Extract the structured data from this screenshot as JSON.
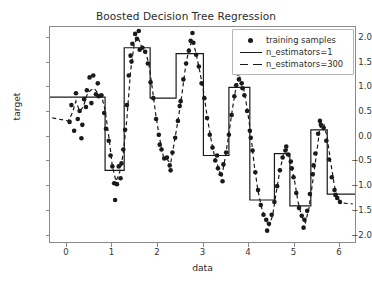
{
  "figure": {
    "width": 372,
    "height": 291,
    "background": "#ffffff"
  },
  "chart_data": {
    "type": "scatter",
    "title": "Boosted Decision Tree Regression",
    "xlabel": "data",
    "ylabel": "target",
    "xlim": [
      -0.35,
      6.35
    ],
    "ylim": [
      -2.15,
      2.2
    ],
    "xticks": [
      0,
      1,
      2,
      3,
      4,
      5,
      6
    ],
    "xtick_labels": [
      "0",
      "1",
      "2",
      "3",
      "4",
      "5",
      "6"
    ],
    "yticks": [
      -2.0,
      -1.5,
      -1.0,
      -0.5,
      0.0,
      0.5,
      1.0,
      1.5,
      2.0
    ],
    "ytick_labels": [
      "−2.0",
      "−1.5",
      "−1.0",
      "−0.5",
      "0.0",
      "0.5",
      "1.0",
      "1.5",
      "2.0"
    ],
    "grid": false,
    "legend_position": "upper right",
    "legend": [
      {
        "label": "training samples",
        "style": "marker",
        "marker": "o",
        "color": "#1a1a1a"
      },
      {
        "label": "n_estimators=1",
        "style": "solid",
        "color": "#1a1a1a"
      },
      {
        "label": "n_estimators=300",
        "style": "dashed",
        "color": "#1a1a1a"
      }
    ],
    "series": [
      {
        "name": "training samples",
        "style": "scatter",
        "color": "#1a1a1a",
        "marker_size": 4.6,
        "points": [
          [
            0.08,
            0.28
          ],
          [
            0.12,
            0.62
          ],
          [
            0.18,
            0.1
          ],
          [
            0.22,
            0.86
          ],
          [
            0.3,
            0.5
          ],
          [
            0.34,
            -0.05
          ],
          [
            0.4,
            0.74
          ],
          [
            0.46,
            0.92
          ],
          [
            0.52,
            1.18
          ],
          [
            0.56,
            0.66
          ],
          [
            0.6,
            1.22
          ],
          [
            0.66,
            0.84
          ],
          [
            0.72,
            0.8
          ],
          [
            0.78,
            0.82
          ],
          [
            0.84,
            0.46
          ],
          [
            0.88,
            0.14
          ],
          [
            0.94,
            -0.1
          ],
          [
            0.98,
            -0.4
          ],
          [
            1.02,
            -0.62
          ],
          [
            1.06,
            -0.96
          ],
          [
            1.12,
            -0.98
          ],
          [
            1.16,
            -0.62
          ],
          [
            1.22,
            -0.56
          ],
          [
            1.26,
            -0.28
          ],
          [
            1.3,
            0.12
          ],
          [
            1.34,
            0.62
          ],
          [
            1.38,
            1.22
          ],
          [
            1.42,
            1.62
          ],
          [
            1.46,
            1.86
          ],
          [
            1.52,
            2.06
          ],
          [
            1.56,
            1.96
          ],
          [
            1.62,
            1.74
          ],
          [
            1.68,
            1.78
          ],
          [
            1.74,
            1.7
          ],
          [
            1.8,
            1.46
          ],
          [
            1.86,
            1.08
          ],
          [
            1.92,
            0.76
          ],
          [
            1.98,
            0.34
          ],
          [
            2.04,
            0.02
          ],
          [
            2.1,
            -0.28
          ],
          [
            2.16,
            -0.46
          ],
          [
            2.22,
            -0.44
          ],
          [
            2.28,
            -0.6
          ],
          [
            2.34,
            -0.34
          ],
          [
            2.4,
            -0.04
          ],
          [
            2.46,
            0.3
          ],
          [
            2.52,
            0.7
          ],
          [
            2.58,
            1.14
          ],
          [
            2.64,
            1.46
          ],
          [
            2.7,
            1.72
          ],
          [
            2.74,
            1.92
          ],
          [
            2.8,
            1.88
          ],
          [
            2.86,
            1.64
          ],
          [
            2.92,
            1.4
          ],
          [
            2.98,
            1.06
          ],
          [
            3.04,
            0.76
          ],
          [
            3.1,
            0.36
          ],
          [
            3.16,
            0.02
          ],
          [
            3.22,
            -0.24
          ],
          [
            3.28,
            -0.5
          ],
          [
            3.34,
            -0.66
          ],
          [
            3.4,
            -0.78
          ],
          [
            3.46,
            -0.58
          ],
          [
            3.52,
            -0.34
          ],
          [
            3.58,
            0.02
          ],
          [
            3.64,
            0.42
          ],
          [
            3.7,
            0.8
          ],
          [
            3.74,
            1.02
          ],
          [
            3.8,
            1.14
          ],
          [
            3.86,
            1.06
          ],
          [
            3.92,
            0.82
          ],
          [
            3.98,
            0.5
          ],
          [
            4.04,
            0.1
          ],
          [
            4.1,
            -0.3
          ],
          [
            4.16,
            -0.74
          ],
          [
            4.22,
            -1.1
          ],
          [
            4.28,
            -1.4
          ],
          [
            4.34,
            -1.6
          ],
          [
            4.4,
            -1.7
          ],
          [
            4.46,
            -1.78
          ],
          [
            4.52,
            -1.6
          ],
          [
            4.58,
            -1.34
          ],
          [
            4.64,
            -1.02
          ],
          [
            4.7,
            -0.7
          ],
          [
            4.76,
            -0.44
          ],
          [
            4.82,
            -0.3
          ],
          [
            4.88,
            -0.38
          ],
          [
            4.94,
            -0.52
          ],
          [
            5.0,
            -0.84
          ],
          [
            5.06,
            -1.16
          ],
          [
            5.12,
            -1.46
          ],
          [
            5.18,
            -1.62
          ],
          [
            5.24,
            -1.7
          ],
          [
            5.3,
            -1.52
          ],
          [
            5.36,
            -1.18
          ],
          [
            5.42,
            -0.78
          ],
          [
            5.48,
            -0.36
          ],
          [
            5.54,
            0.04
          ],
          [
            5.6,
            0.22
          ],
          [
            5.66,
            0.16
          ],
          [
            5.72,
            -0.1
          ],
          [
            5.78,
            -0.48
          ],
          [
            5.84,
            -0.84
          ],
          [
            5.9,
            -1.1
          ],
          [
            5.96,
            -1.26
          ],
          [
            6.02,
            -1.34
          ],
          [
            0.26,
            0.34
          ],
          [
            0.44,
            0.58
          ],
          [
            0.7,
            1.06
          ],
          [
            1.08,
            -1.3
          ],
          [
            1.6,
            2.12
          ],
          [
            2.06,
            -0.18
          ],
          [
            2.78,
            2.08
          ],
          [
            3.44,
            -0.92
          ],
          [
            3.78,
            1.26
          ],
          [
            4.42,
            -1.92
          ],
          [
            4.84,
            -0.22
          ],
          [
            5.22,
            -1.86
          ],
          [
            5.58,
            0.3
          ],
          [
            5.92,
            -1.2
          ],
          [
            0.36,
            0.22
          ],
          [
            1.2,
            -0.86
          ],
          [
            2.3,
            -0.7
          ],
          [
            3.32,
            -0.4
          ],
          [
            4.06,
            -0.04
          ],
          [
            4.96,
            -0.66
          ],
          [
            2.5,
            0.6
          ],
          [
            3.88,
            0.96
          ],
          [
            1.44,
            1.5
          ],
          [
            5.44,
            -0.6
          ]
        ]
      },
      {
        "name": "n_estimators=1",
        "style": "solid",
        "color": "#1a1a1a",
        "linewidth": 1.2,
        "comment": "single decision-tree stump prediction: piecewise-constant step function",
        "steps": [
          [
            -0.35,
            0.78
          ],
          [
            0.86,
            0.78
          ],
          [
            0.86,
            -0.7
          ],
          [
            1.28,
            -0.7
          ],
          [
            1.28,
            1.78
          ],
          [
            1.85,
            1.78
          ],
          [
            1.85,
            0.76
          ],
          [
            2.42,
            0.76
          ],
          [
            2.42,
            1.66
          ],
          [
            3.02,
            1.66
          ],
          [
            3.02,
            -0.4
          ],
          [
            3.58,
            -0.4
          ],
          [
            3.58,
            0.98
          ],
          [
            4.04,
            0.98
          ],
          [
            4.04,
            -1.3
          ],
          [
            4.58,
            -1.3
          ],
          [
            4.58,
            -0.36
          ],
          [
            4.92,
            -0.36
          ],
          [
            4.92,
            -1.42
          ],
          [
            5.38,
            -1.42
          ],
          [
            5.38,
            0.12
          ],
          [
            5.74,
            0.12
          ],
          [
            5.74,
            -1.18
          ],
          [
            6.35,
            -1.18
          ]
        ]
      },
      {
        "name": "n_estimators=300",
        "style": "dashed",
        "color": "#1a1a1a",
        "linewidth": 1.2,
        "dash": [
          4,
          3
        ],
        "comment": "boosted ensemble prediction: closely follows the noisy training samples",
        "points": [
          [
            -0.3,
            0.36
          ],
          [
            0.05,
            0.3
          ],
          [
            0.14,
            0.46
          ],
          [
            0.22,
            0.7
          ],
          [
            0.3,
            0.5
          ],
          [
            0.38,
            0.58
          ],
          [
            0.46,
            0.82
          ],
          [
            0.54,
            0.92
          ],
          [
            0.62,
            0.96
          ],
          [
            0.7,
            0.86
          ],
          [
            0.78,
            0.82
          ],
          [
            0.86,
            0.52
          ],
          [
            0.94,
            0.0
          ],
          [
            1.02,
            -0.62
          ],
          [
            1.1,
            -0.92
          ],
          [
            1.18,
            -0.74
          ],
          [
            1.26,
            -0.36
          ],
          [
            1.34,
            0.36
          ],
          [
            1.42,
            1.3
          ],
          [
            1.5,
            1.86
          ],
          [
            1.58,
            2.0
          ],
          [
            1.66,
            1.8
          ],
          [
            1.74,
            1.72
          ],
          [
            1.82,
            1.46
          ],
          [
            1.9,
            0.94
          ],
          [
            1.98,
            0.38
          ],
          [
            2.06,
            -0.06
          ],
          [
            2.14,
            -0.42
          ],
          [
            2.22,
            -0.48
          ],
          [
            2.3,
            -0.56
          ],
          [
            2.38,
            -0.14
          ],
          [
            2.46,
            0.3
          ],
          [
            2.54,
            0.78
          ],
          [
            2.62,
            1.34
          ],
          [
            2.7,
            1.76
          ],
          [
            2.78,
            1.94
          ],
          [
            2.86,
            1.66
          ],
          [
            2.94,
            1.3
          ],
          [
            3.02,
            0.92
          ],
          [
            3.1,
            0.4
          ],
          [
            3.18,
            -0.04
          ],
          [
            3.26,
            -0.4
          ],
          [
            3.34,
            -0.62
          ],
          [
            3.42,
            -0.84
          ],
          [
            3.5,
            -0.44
          ],
          [
            3.58,
            0.04
          ],
          [
            3.66,
            0.56
          ],
          [
            3.74,
            1.0
          ],
          [
            3.82,
            1.18
          ],
          [
            3.9,
            0.98
          ],
          [
            3.98,
            0.56
          ],
          [
            4.06,
            0.04
          ],
          [
            4.14,
            -0.62
          ],
          [
            4.22,
            -1.12
          ],
          [
            4.3,
            -1.46
          ],
          [
            4.38,
            -1.7
          ],
          [
            4.46,
            -1.82
          ],
          [
            4.54,
            -1.62
          ],
          [
            4.62,
            -1.14
          ],
          [
            4.7,
            -0.7
          ],
          [
            4.78,
            -0.38
          ],
          [
            4.86,
            -0.28
          ],
          [
            4.94,
            -0.56
          ],
          [
            5.02,
            -0.9
          ],
          [
            5.1,
            -1.34
          ],
          [
            5.18,
            -1.64
          ],
          [
            5.26,
            -1.76
          ],
          [
            5.34,
            -1.46
          ],
          [
            5.42,
            -0.94
          ],
          [
            5.5,
            -0.4
          ],
          [
            5.58,
            0.16
          ],
          [
            5.66,
            0.26
          ],
          [
            5.74,
            -0.04
          ],
          [
            5.82,
            -0.56
          ],
          [
            5.9,
            -1.02
          ],
          [
            5.98,
            -1.28
          ],
          [
            6.06,
            -1.36
          ],
          [
            6.3,
            -1.38
          ]
        ]
      }
    ]
  }
}
